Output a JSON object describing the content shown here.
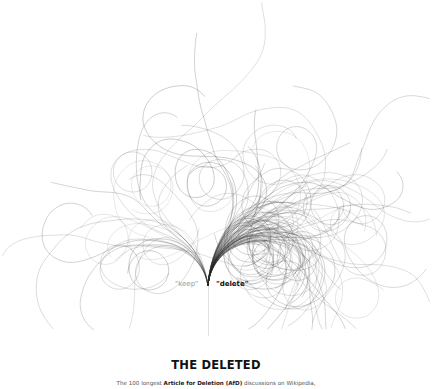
{
  "chart_data": {
    "type": "tree",
    "title": "THE DELETED",
    "subtitle_parts": [
      "The 100 longest ",
      "Article for Deletion (AfD)",
      " discussions on Wikipedia,"
    ],
    "count": 100,
    "branches": [
      {
        "name": "keep",
        "label": "\"keep\"",
        "direction": "left",
        "color": "#9a9a9a"
      },
      {
        "name": "delete",
        "label": "\"delete\"",
        "direction": "right",
        "color": "#111111"
      }
    ],
    "root": {
      "x": 208,
      "y": 286
    },
    "line_color": "#2a2a2a",
    "grid": false,
    "legend": "none"
  },
  "labels": {
    "keep": "\"keep\"",
    "delete": "\"delete\"",
    "title": "THE DELETED",
    "subtitle_pre": "The 100 longest ",
    "subtitle_bold": "Article for Deletion (AfD)",
    "subtitle_post": " discussions on Wikipedia,"
  }
}
